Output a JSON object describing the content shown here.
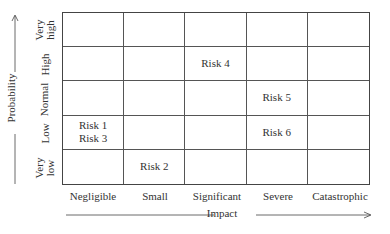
{
  "axes": {
    "x_title": "Impact",
    "y_title": "Probability",
    "x_categories": [
      "Negligible",
      "Small",
      "Significant",
      "Severe",
      "Catastrophic"
    ],
    "y_categories": [
      "Very\nhigh",
      "High",
      "Normal",
      "Low",
      "Very\nlow"
    ]
  },
  "cells": [
    [
      "",
      "",
      "",
      "",
      ""
    ],
    [
      "",
      "",
      "Risk 4",
      "",
      ""
    ],
    [
      "",
      "",
      "",
      "Risk 5",
      ""
    ],
    [
      "Risk 1\nRisk 3",
      "",
      "",
      "Risk 6",
      ""
    ],
    [
      "",
      "Risk 2",
      "",
      "",
      ""
    ]
  ],
  "risks": [
    {
      "label": "Risk 1",
      "impact": "Negligible",
      "probability": "Low"
    },
    {
      "label": "Risk 2",
      "impact": "Small",
      "probability": "Very low"
    },
    {
      "label": "Risk 3",
      "impact": "Negligible",
      "probability": "Low"
    },
    {
      "label": "Risk 4",
      "impact": "Significant",
      "probability": "High"
    },
    {
      "label": "Risk 5",
      "impact": "Severe",
      "probability": "Normal"
    },
    {
      "label": "Risk 6",
      "impact": "Severe",
      "probability": "Low"
    }
  ]
}
